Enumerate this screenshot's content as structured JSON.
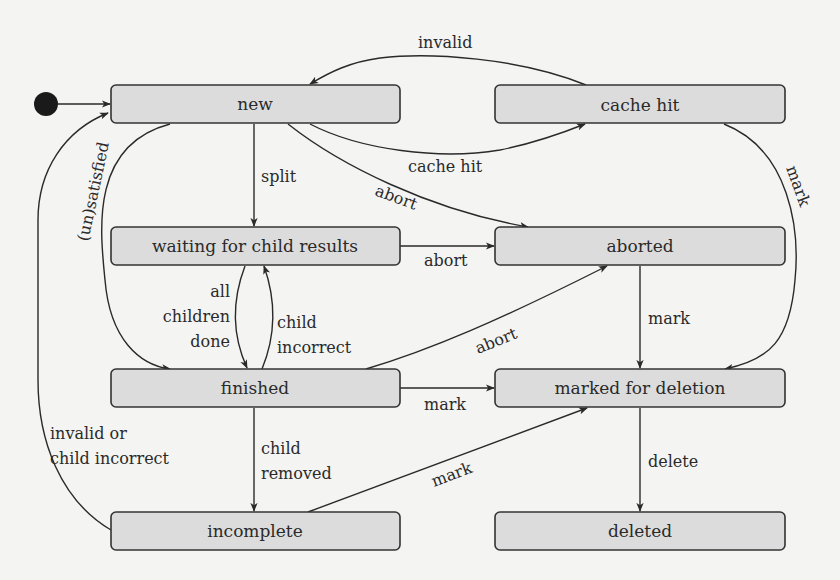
{
  "diagram": {
    "type": "state-machine",
    "initial_state": "new",
    "states": {
      "new": "new",
      "cache_hit": "cache hit",
      "waiting": "waiting for child results",
      "aborted": "aborted",
      "finished": "finished",
      "marked": "marked for deletion",
      "incomplete": "incomplete",
      "deleted": "deleted"
    },
    "edge_labels": {
      "invalid": "invalid",
      "cache_hit": "cache hit",
      "split": "split",
      "abort_new": "abort",
      "abort_waiting": "abort",
      "abort_finished": "abort",
      "unsatisfied": "(un)satisfied",
      "all_children_done_1": "all",
      "all_children_done_2": "children",
      "all_children_done_3": "done",
      "child_incorrect_1": "child",
      "child_incorrect_2": "incorrect",
      "mark_cache": "mark",
      "mark_aborted": "mark",
      "mark_finished": "mark",
      "mark_incomplete": "mark",
      "child_removed_1": "child",
      "child_removed_2": "removed",
      "invalid_or_1": "invalid or",
      "invalid_or_2": "child incorrect",
      "delete": "delete"
    },
    "transitions": [
      {
        "from": "initial",
        "to": "new",
        "label": ""
      },
      {
        "from": "cache hit",
        "to": "new",
        "label": "invalid"
      },
      {
        "from": "new",
        "to": "cache hit",
        "label": "cache hit"
      },
      {
        "from": "new",
        "to": "waiting for child results",
        "label": "split"
      },
      {
        "from": "new",
        "to": "aborted",
        "label": "abort"
      },
      {
        "from": "new",
        "to": "finished",
        "label": ""
      },
      {
        "from": "waiting for child results",
        "to": "aborted",
        "label": "abort"
      },
      {
        "from": "waiting for child results",
        "to": "finished",
        "label": "all children done"
      },
      {
        "from": "finished",
        "to": "waiting for child results",
        "label": "child incorrect"
      },
      {
        "from": "finished",
        "to": "aborted",
        "label": "abort"
      },
      {
        "from": "finished",
        "to": "marked for deletion",
        "label": "mark"
      },
      {
        "from": "finished",
        "to": "incomplete",
        "label": "child removed"
      },
      {
        "from": "finished",
        "to": "new",
        "label": "(un)satisfied"
      },
      {
        "from": "incomplete",
        "to": "new",
        "label": "invalid or child incorrect"
      },
      {
        "from": "incomplete",
        "to": "marked for deletion",
        "label": "mark"
      },
      {
        "from": "cache hit",
        "to": "marked for deletion",
        "label": "mark"
      },
      {
        "from": "aborted",
        "to": "marked for deletion",
        "label": "mark"
      },
      {
        "from": "marked for deletion",
        "to": "deleted",
        "label": "delete"
      }
    ]
  }
}
